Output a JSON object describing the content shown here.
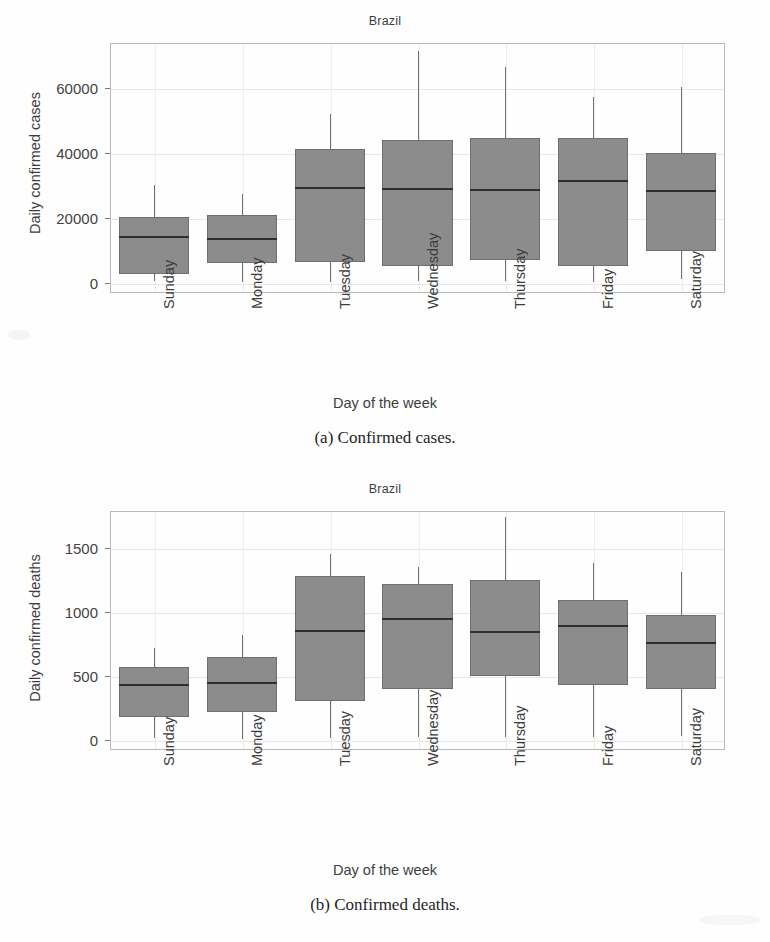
{
  "figure": {
    "caption_a": "(a) Confirmed cases.",
    "caption_b": "(b) Confirmed deaths."
  },
  "colors": {
    "box_fill": "#8c8c8c",
    "box_edge": "#6f6f6f",
    "median": "#2e2e2e",
    "whisker": "#717171",
    "grid": "#e7e7e7",
    "frame": "#b9b9b9",
    "text": "#3d3d3d"
  },
  "chart_data": [
    {
      "id": "confirmed-cases",
      "type": "box",
      "title": "Brazil",
      "xlabel": "Day of the week",
      "ylabel": "Daily confirmed cases",
      "ylim": [
        -3000,
        74000
      ],
      "yticks": [
        0,
        20000,
        40000,
        60000
      ],
      "ytick_labels": [
        "0",
        "20000",
        "40000",
        "60000"
      ],
      "grid": true,
      "legend": "none",
      "categories": [
        "Sunday",
        "Monday",
        "Tuesday",
        "Wednesday",
        "Thursday",
        "Friday",
        "Saturday"
      ],
      "boxes": [
        {
          "category": "Sunday",
          "whisker_low": 700,
          "q1": 3000,
          "median": 14700,
          "q3": 20400,
          "whisker_high": 30200
        },
        {
          "category": "Monday",
          "whisker_low": 400,
          "q1": 6300,
          "median": 13900,
          "q3": 21000,
          "whisker_high": 27500
        },
        {
          "category": "Tuesday",
          "whisker_low": 500,
          "q1": 6400,
          "median": 29600,
          "q3": 41500,
          "whisker_high": 52000
        },
        {
          "category": "Wednesday",
          "whisker_low": 600,
          "q1": 5400,
          "median": 29300,
          "q3": 44200,
          "whisker_high": 71500
        },
        {
          "category": "Thursday",
          "whisker_low": 600,
          "q1": 7100,
          "median": 28900,
          "q3": 44700,
          "whisker_high": 66500
        },
        {
          "category": "Friday",
          "whisker_low": 500,
          "q1": 5400,
          "median": 31700,
          "q3": 44800,
          "whisker_high": 57500
        },
        {
          "category": "Saturday",
          "whisker_low": 1200,
          "q1": 9800,
          "median": 28600,
          "q3": 40000,
          "whisker_high": 60500
        }
      ]
    },
    {
      "id": "confirmed-deaths",
      "type": "box",
      "title": "Brazil",
      "xlabel": "Day of the week",
      "ylabel": "Daily confirmed deaths",
      "ylim": [
        -80,
        1790
      ],
      "yticks": [
        0,
        500,
        1000,
        1500
      ],
      "ytick_labels": [
        "0",
        "500",
        "1000",
        "1500"
      ],
      "grid": true,
      "legend": "none",
      "categories": [
        "Sunday",
        "Monday",
        "Tuesday",
        "Wednesday",
        "Thursday",
        "Friday",
        "Saturday"
      ],
      "boxes": [
        {
          "category": "Sunday",
          "whisker_low": 10,
          "q1": 180,
          "median": 440,
          "q3": 570,
          "whisker_high": 720
        },
        {
          "category": "Monday",
          "whisker_low": 5,
          "q1": 215,
          "median": 455,
          "q3": 645,
          "whisker_high": 820
        },
        {
          "category": "Tuesday",
          "whisker_low": 15,
          "q1": 305,
          "median": 860,
          "q3": 1285,
          "whisker_high": 1455
        },
        {
          "category": "Wednesday",
          "whisker_low": 20,
          "q1": 400,
          "median": 955,
          "q3": 1215,
          "whisker_high": 1350
        },
        {
          "category": "Thursday",
          "whisker_low": 20,
          "q1": 500,
          "median": 850,
          "q3": 1250,
          "whisker_high": 1740
        },
        {
          "category": "Friday",
          "whisker_low": 20,
          "q1": 430,
          "median": 900,
          "q3": 1090,
          "whisker_high": 1380
        },
        {
          "category": "Saturday",
          "whisker_low": 30,
          "q1": 395,
          "median": 765,
          "q3": 975,
          "whisker_high": 1310
        }
      ]
    }
  ]
}
